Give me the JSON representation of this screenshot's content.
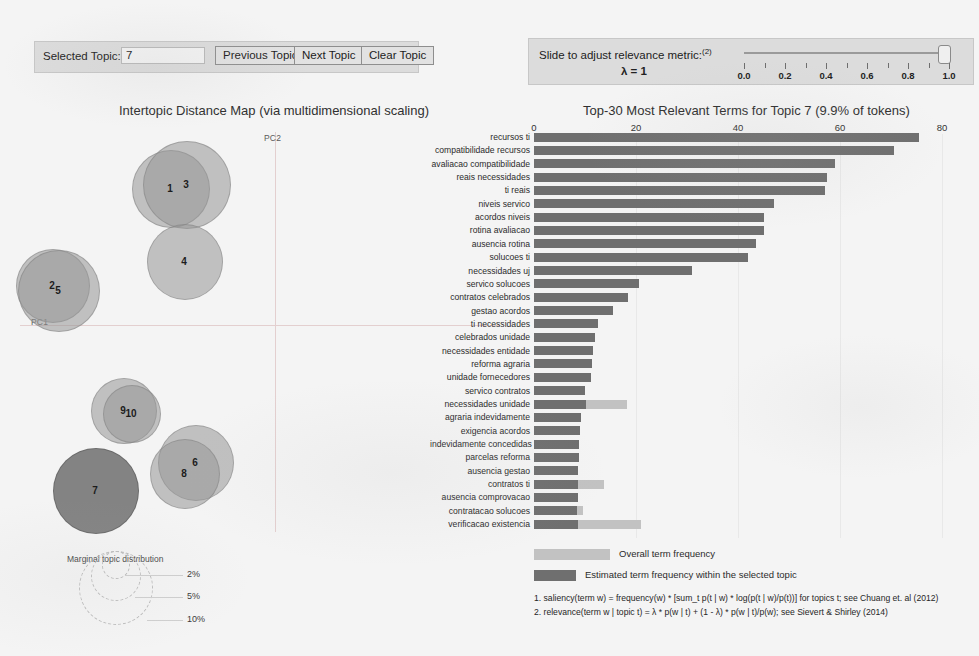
{
  "topic_panel": {
    "selected_topic_label": "Selected Topic:",
    "topic_value": "7",
    "previous_button": "Previous Topic",
    "next_button": "Next Topic",
    "clear_button": "Clear Topic"
  },
  "lambda_panel": {
    "slide_label": "Slide to adjust relevance metric:",
    "slide_superscript": "(2)",
    "lambda_value": "λ = 1",
    "ticks": [
      "0.0",
      "0.2",
      "0.4",
      "0.6",
      "0.8",
      "1.0"
    ],
    "slider_position": 1.0
  },
  "left_chart": {
    "title": "Intertopic Distance Map (via multidimensional scaling)",
    "axis_x_label": "PC1",
    "axis_y_label": "PC2",
    "topics": [
      {
        "id": "1",
        "x": 170,
        "y": 68,
        "r": 38,
        "selected": false
      },
      {
        "id": "3",
        "x": 186,
        "y": 64,
        "r": 43,
        "selected": false
      },
      {
        "id": "4",
        "x": 184,
        "y": 141,
        "r": 37,
        "selected": false
      },
      {
        "id": "2",
        "x": 52,
        "y": 165,
        "r": 36,
        "selected": false
      },
      {
        "id": "5",
        "x": 58,
        "y": 170,
        "r": 40,
        "selected": false
      },
      {
        "id": "9",
        "x": 123,
        "y": 290,
        "r": 32,
        "selected": false
      },
      {
        "id": "10",
        "x": 131,
        "y": 293,
        "r": 28,
        "selected": false
      },
      {
        "id": "6",
        "x": 195,
        "y": 342,
        "r": 37,
        "selected": false
      },
      {
        "id": "8",
        "x": 184,
        "y": 353,
        "r": 34,
        "selected": false
      },
      {
        "id": "7",
        "x": 95,
        "y": 370,
        "r": 42,
        "selected": true
      }
    ],
    "marginal_legend": {
      "title": "Marginal topic distribution",
      "levels": [
        "2%",
        "5%",
        "10%"
      ]
    }
  },
  "chart_data": {
    "type": "bar",
    "title": "Top-30 Most Relevant Terms for Topic 7 (9.9% of tokens)",
    "orientation": "horizontal",
    "xlabel": "",
    "ylabel": "",
    "xlim": [
      0,
      80
    ],
    "xticks": [
      0,
      20,
      40,
      60,
      80
    ],
    "grid": true,
    "legend_position": "bottom",
    "categories": [
      "recursos ti",
      "compatibilidade recursos",
      "avaliacao compatibilidade",
      "reais necessidades",
      "ti reais",
      "niveis servico",
      "acordos niveis",
      "rotina avaliacao",
      "ausencia rotina",
      "solucoes ti",
      "necessidades uj",
      "servico solucoes",
      "contratos celebrados",
      "gestao acordos",
      "ti necessidades",
      "celebrados unidade",
      "necessidades entidade",
      "reforma agraria",
      "unidade fornecedores",
      "servico contratos",
      "necessidades unidade",
      "agraria indevidamente",
      "exigencia acordos",
      "indevidamente concedidas",
      "parcelas reforma",
      "ausencia gestao",
      "contratos ti",
      "ausencia comprovacao",
      "contratacao solucoes",
      "verificacao existencia"
    ],
    "series": [
      {
        "name": "Overall term frequency",
        "color": "#c2c2c2",
        "values": [
          75.5,
          70.5,
          59.0,
          57.5,
          57.0,
          47.0,
          45.0,
          45.0,
          43.5,
          42.0,
          31.0,
          20.5,
          18.5,
          15.5,
          12.5,
          12.0,
          11.6,
          11.4,
          11.2,
          10.0,
          18.2,
          9.2,
          9.0,
          8.8,
          8.8,
          8.7,
          13.8,
          8.6,
          9.6,
          21.0
        ]
      },
      {
        "name": "Estimated term frequency within the selected topic",
        "color": "#6f6f6f",
        "values": [
          75.5,
          70.5,
          59.0,
          57.5,
          57.0,
          47.0,
          45.0,
          45.0,
          43.5,
          42.0,
          31.0,
          20.5,
          18.5,
          15.5,
          12.5,
          12.0,
          11.6,
          11.4,
          11.2,
          10.0,
          10.2,
          9.2,
          9.0,
          8.8,
          8.8,
          8.7,
          8.7,
          8.6,
          8.5,
          8.6
        ]
      }
    ]
  },
  "legend": {
    "overall_label": "Overall term frequency",
    "topic_label": "Estimated term frequency within the selected topic"
  },
  "footnotes": [
    "1. saliency(term w) = frequency(w) * [sum_t p(t | w) * log(p(t | w)/p(t))] for topics t; see Chuang et. al (2012)",
    "2. relevance(term w | topic t) = λ * p(w | t) + (1 - λ) * p(w | t)/p(w); see Sievert & Shirley (2014)"
  ]
}
